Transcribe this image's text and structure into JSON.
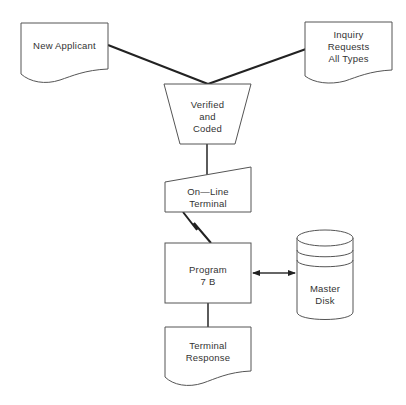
{
  "diagram": {
    "type": "flowchart",
    "nodes": [
      {
        "id": "new-applicant",
        "shape": "document",
        "label": "New Applicant"
      },
      {
        "id": "inquiry-requests",
        "shape": "document",
        "label": "Inquiry\nRequests\nAll Types"
      },
      {
        "id": "verified-coded",
        "shape": "manual-operation",
        "label": "Verified\nand\nCoded"
      },
      {
        "id": "online-terminal",
        "shape": "manual-input",
        "label": "On—Line\nTerminal"
      },
      {
        "id": "program-7b",
        "shape": "process",
        "label": "Program\n7  B"
      },
      {
        "id": "master-disk",
        "shape": "magnetic-disk",
        "label": "Master\nDisk"
      },
      {
        "id": "terminal-response",
        "shape": "document",
        "label": "Terminal\nResponse"
      }
    ],
    "edges": [
      {
        "from": "new-applicant",
        "to": "verified-coded",
        "style": "line"
      },
      {
        "from": "inquiry-requests",
        "to": "verified-coded",
        "style": "line"
      },
      {
        "from": "verified-coded",
        "to": "online-terminal",
        "style": "line"
      },
      {
        "from": "online-terminal",
        "to": "program-7b",
        "style": "communication-link"
      },
      {
        "from": "program-7b",
        "to": "master-disk",
        "style": "bidirectional-arrow"
      },
      {
        "from": "program-7b",
        "to": "terminal-response",
        "style": "line"
      }
    ]
  },
  "labels": {
    "new_applicant": "New Applicant",
    "inquiry_requests": "Inquiry\nRequests\nAll Types",
    "verified_coded": "Verified\nand\nCoded",
    "online_terminal": "On—Line\nTerminal",
    "program_7b": "Program\n7  B",
    "master_disk": "Master\nDisk",
    "terminal_response": "Terminal\nResponse"
  },
  "colors": {
    "background": "#ffffff",
    "shape_stroke": "#555555",
    "connector": "#222222",
    "text": "#333333"
  }
}
